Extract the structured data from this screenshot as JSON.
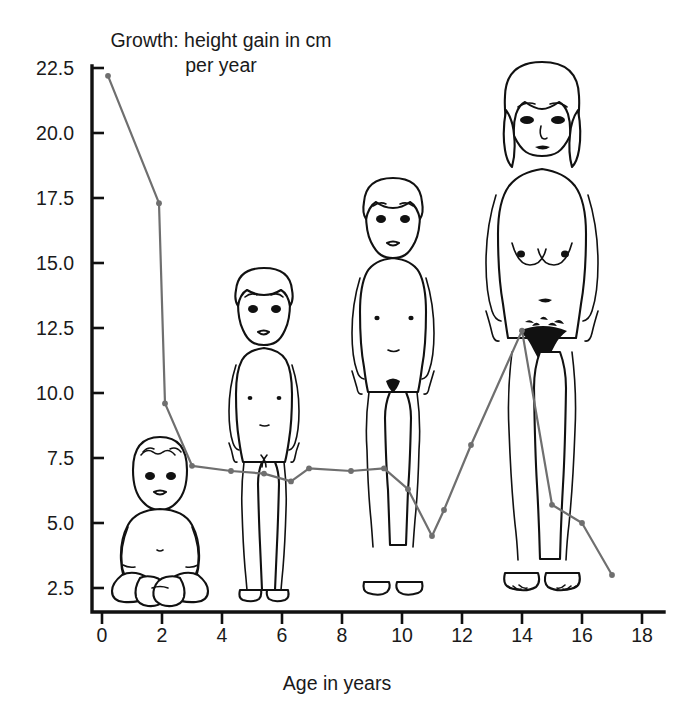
{
  "chart_data": {
    "type": "line",
    "title": "Growth: height gain in cm per year",
    "xlabel": "Age in years",
    "ylabel": "",
    "xlim": [
      0,
      18
    ],
    "ylim": [
      2.5,
      22.5
    ],
    "xticks": [
      0,
      2,
      4,
      6,
      8,
      10,
      12,
      14,
      16,
      18
    ],
    "yticks": [
      2.5,
      5.0,
      7.5,
      10.0,
      12.5,
      15.0,
      17.5,
      20.0,
      22.5
    ],
    "xtick_labels": [
      "0",
      "2",
      "4",
      "6",
      "8",
      "10",
      "12",
      "14",
      "16",
      "18"
    ],
    "ytick_labels": [
      "2.5",
      "5.0",
      "7.5",
      "10.0",
      "12.5",
      "15.0",
      "17.5",
      "20.0",
      "22.5"
    ],
    "grid": false,
    "legend": false,
    "line_color": "#6f6f6f",
    "series": [
      {
        "name": "Height gain",
        "x": [
          0.2,
          1.9,
          2.1,
          3.0,
          4.3,
          5.4,
          6.3,
          6.9,
          8.3,
          9.4,
          10.2,
          11.0,
          11.4,
          12.3,
          14.0,
          15.0,
          16.0,
          17.0
        ],
        "y": [
          22.2,
          17.3,
          9.6,
          7.2,
          7.0,
          6.9,
          6.6,
          7.1,
          7.0,
          7.1,
          6.3,
          4.5,
          5.5,
          8.0,
          12.4,
          5.7,
          5.0,
          3.0
        ]
      }
    ]
  },
  "figures": {
    "caption": "Line drawings of a human at four ages shown behind the curve",
    "items": [
      {
        "name": "infant-figure",
        "age_label": "infant"
      },
      {
        "name": "young-child-figure",
        "age_label": "young child"
      },
      {
        "name": "older-child-figure",
        "age_label": "older child"
      },
      {
        "name": "adolescent-figure",
        "age_label": "adolescent"
      }
    ]
  }
}
